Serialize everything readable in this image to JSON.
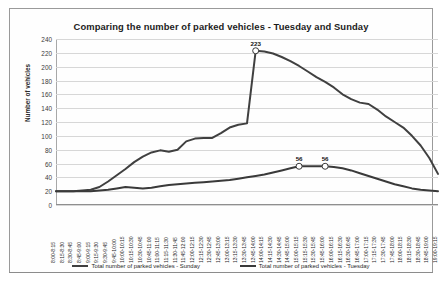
{
  "chart_data": {
    "type": "line",
    "title": "Comparing the number of parked vehicles - Tuesday and Sunday",
    "xlabel": "",
    "ylabel": "Number of vehicles",
    "ylim": [
      0,
      240
    ],
    "ytick_step": 20,
    "grid": true,
    "legend_position": "bottom",
    "yticks": [
      "0",
      "20",
      "40",
      "60",
      "80",
      "100",
      "120",
      "140",
      "160",
      "180",
      "200",
      "220",
      "240"
    ],
    "categories": [
      "8:00-8:15",
      "8:15-8:30",
      "8:30-8:45",
      "8:45-9:00",
      "9:00-9:15",
      "9:15-9:30",
      "9:30-9:45",
      "9:45-10:00",
      "10:00-10:15",
      "10:15-10:30",
      "10:30-10:45",
      "10:45-11:00",
      "11:00-11:15",
      "11:15-11:30",
      "11:30-11:45",
      "11:45-12:00",
      "12:00-12:15",
      "12:15-12:30",
      "12:30-12:45",
      "12:45-13:00",
      "13:00-13:15",
      "13:15-13:30",
      "13:30-13:45",
      "13:45-14:00",
      "14:00-14:15",
      "14:15-14:30",
      "14:30-14:45",
      "14:45-15:00",
      "15:00-15:15",
      "15:15-15:30",
      "15:30-15:45",
      "15:45-16:00",
      "16:00-16:15",
      "16:15-16:30",
      "16:30-16:45",
      "16:45-17:00",
      "17:00-17:15",
      "17:15-17:30",
      "17:30-17:45",
      "17:45-18:00",
      "18:00-18:15",
      "18:15-18:30",
      "18:30-18:45",
      "18:45-19:00",
      "19:00-19:15"
    ],
    "series": [
      {
        "name": "Total number of parked vehicles - Sunday",
        "color": "#404040",
        "values": [
          20,
          20,
          20,
          21,
          22,
          26,
          34,
          43,
          52,
          62,
          70,
          76,
          79,
          77,
          80,
          92,
          96,
          97,
          97,
          104,
          112,
          116,
          118,
          223,
          222,
          219,
          214,
          208,
          201,
          193,
          185,
          178,
          170,
          160,
          153,
          148,
          146,
          138,
          128,
          120,
          112,
          100,
          86,
          68,
          45
        ]
      },
      {
        "name": "Total number of parked vehicles - Tuesday",
        "color": "#3a3a3a",
        "values": [
          20,
          20,
          20,
          20,
          20,
          21,
          22,
          24,
          26,
          25,
          24,
          25,
          27,
          29,
          30,
          31,
          32,
          33,
          34,
          35,
          36,
          38,
          40,
          42,
          44,
          47,
          50,
          53,
          56,
          56,
          56,
          56,
          55,
          53,
          50,
          46,
          42,
          38,
          34,
          30,
          27,
          24,
          22,
          21,
          20
        ]
      }
    ],
    "point_labels": [
      {
        "series": "Total number of parked vehicles - Sunday",
        "index": 23,
        "value": "223"
      },
      {
        "series": "Total number of parked vehicles - Tuesday",
        "index": 28,
        "value": "56"
      },
      {
        "series": "Total number of parked vehicles - Tuesday",
        "index": 31,
        "value": "56"
      }
    ]
  }
}
